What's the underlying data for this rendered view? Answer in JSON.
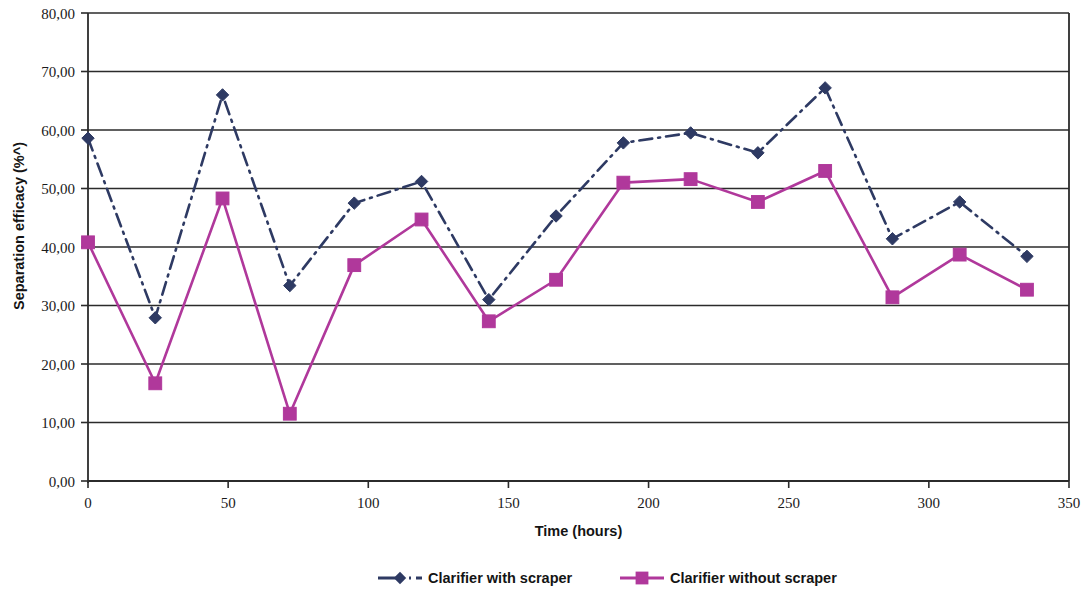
{
  "chart_data": {
    "type": "line",
    "title": "",
    "xlabel": "Time (hours)",
    "ylabel": "Separation efficacy (%^)",
    "xlim": [
      0,
      350
    ],
    "ylim": [
      0,
      80
    ],
    "grid": true,
    "legend_position": "bottom",
    "x_tick_labels": [
      "0",
      "50",
      "100",
      "150",
      "200",
      "250",
      "300",
      "350"
    ],
    "x_ticks": [
      0,
      50,
      100,
      150,
      200,
      250,
      300,
      350
    ],
    "y_tick_labels": [
      "0,00",
      "10,00",
      "20,00",
      "30,00",
      "40,00",
      "50,00",
      "60,00",
      "70,00",
      "80,00"
    ],
    "y_ticks": [
      0,
      10,
      20,
      30,
      40,
      50,
      60,
      70,
      80
    ],
    "x": [
      0,
      24,
      48,
      72,
      95,
      119,
      143,
      167,
      191,
      215,
      239,
      263,
      287,
      311,
      335
    ],
    "series": [
      {
        "name": "Clarifier with scraper",
        "color": "#2e3a63",
        "marker": "diamond",
        "line_style": "dash-dot",
        "values": [
          58.6,
          27.9,
          66.0,
          33.4,
          47.5,
          51.2,
          31.0,
          45.3,
          57.8,
          59.5,
          56.1,
          67.2,
          41.4,
          47.7,
          38.4
        ]
      },
      {
        "name": "Clarifier without scraper",
        "color": "#b0389b",
        "marker": "square",
        "line_style": "solid",
        "values": [
          40.8,
          16.7,
          48.3,
          11.5,
          36.9,
          44.7,
          27.3,
          34.4,
          51.0,
          51.6,
          47.7,
          53.0,
          31.4,
          38.7,
          32.7
        ]
      }
    ]
  }
}
